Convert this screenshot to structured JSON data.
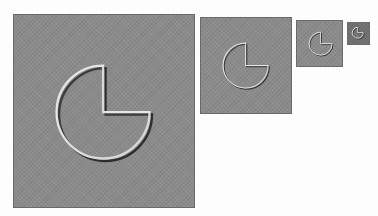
{
  "figure": {
    "colors": {
      "page_background": "#fdfdfd",
      "panel_fill": "#8b8b8b",
      "tiny_panel_fill": "#707070",
      "highlight": "#e6e6e6",
      "shadow": "#2e2e2e"
    },
    "panels": [
      {
        "label": "scale-1",
        "x": 13,
        "y": 14,
        "w": 182,
        "h": 194,
        "cx": 91,
        "cy": 99,
        "r": 47
      },
      {
        "label": "scale-2",
        "x": 200,
        "y": 17,
        "w": 92,
        "h": 97,
        "cx": 46,
        "cy": 49,
        "r": 23
      },
      {
        "label": "scale-3",
        "x": 296,
        "y": 20,
        "w": 47,
        "h": 47,
        "cx": 25,
        "cy": 24,
        "r": 12
      },
      {
        "label": "scale-4",
        "x": 347,
        "y": 22,
        "w": 23,
        "h": 23,
        "cx": 11,
        "cy": 11,
        "r": 6
      }
    ],
    "missing_quadrant": "top-right"
  }
}
